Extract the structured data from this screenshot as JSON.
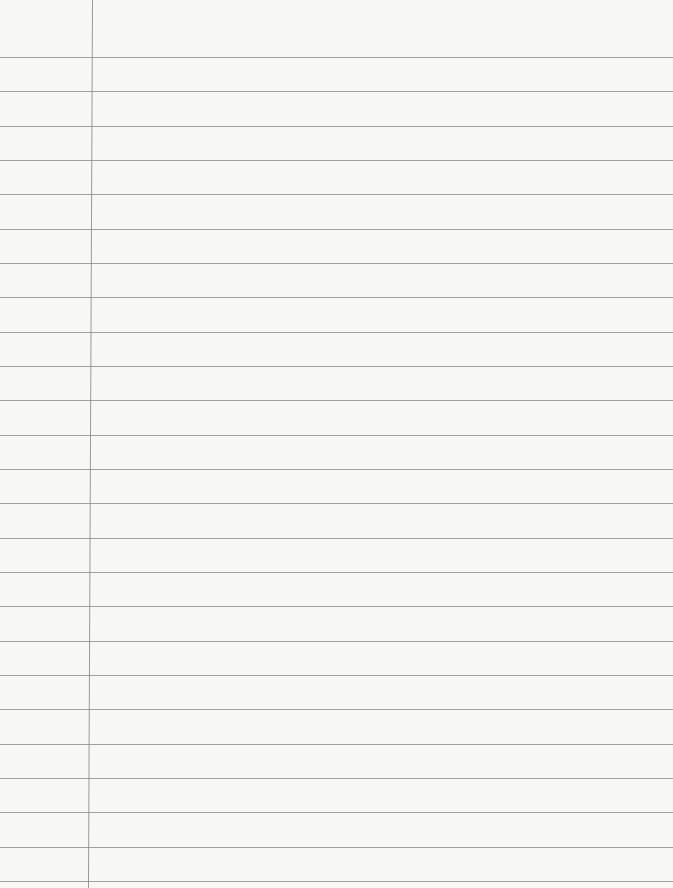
{
  "paper": {
    "type": "lined-notebook-paper",
    "rule_count": 25,
    "first_rule_y": 57,
    "rule_spacing": 34.33,
    "margin_x": 92,
    "colors": {
      "background": "#f7f7f5",
      "rule": "#8a8a88",
      "margin": "#9a9a98"
    }
  }
}
